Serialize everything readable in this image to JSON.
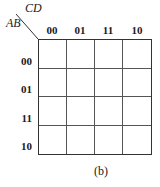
{
  "kmap": {
    "row_var": "AB",
    "col_var": "CD",
    "col_headers": [
      "00",
      "01",
      "11",
      "10"
    ],
    "row_headers": [
      "00",
      "01",
      "11",
      "10"
    ],
    "cells": [
      [
        "",
        "",
        "",
        ""
      ],
      [
        "",
        "",
        "",
        ""
      ],
      [
        "",
        "",
        "",
        ""
      ],
      [
        "",
        "",
        "",
        ""
      ]
    ],
    "caption": "(b)"
  }
}
